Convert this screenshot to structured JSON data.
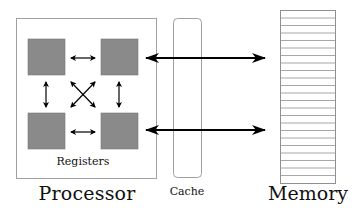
{
  "diagram": {
    "processor": {
      "label": "Processor",
      "registers_label": "Registers",
      "register_count": 4,
      "register_color": "#8a8a8a"
    },
    "cache": {
      "label": "Cache"
    },
    "memory": {
      "label": "Memory",
      "row_count": 23
    },
    "connections": [
      {
        "from": "processor-top-right-register",
        "to": "memory",
        "type": "bidirectional"
      },
      {
        "from": "processor-bottom-right-register",
        "to": "memory",
        "type": "bidirectional"
      }
    ],
    "register_links": [
      "top-left <-> top-right",
      "bottom-left <-> bottom-right",
      "top-left <-> bottom-left",
      "top-right <-> bottom-right",
      "top-left <-> bottom-right",
      "top-right <-> bottom-left"
    ],
    "colors": {
      "line": "#000000",
      "box_border": "#9a9a9a",
      "register_fill": "#8a8a8a",
      "background": "#ffffff"
    }
  }
}
